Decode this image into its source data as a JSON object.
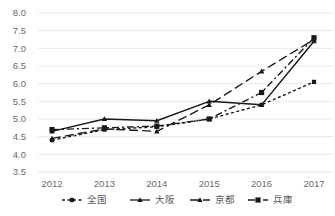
{
  "chart_data": {
    "type": "line",
    "title": "",
    "xlabel": "",
    "ylabel": "",
    "x": [
      "2012",
      "2013",
      "2014",
      "2015",
      "2016",
      "2017"
    ],
    "categories": [
      "2012",
      "2013",
      "2014",
      "2015",
      "2016",
      "2017"
    ],
    "ylim": [
      3.5,
      8.0
    ],
    "ytick_step": 0.5,
    "yticks": [
      "3.5",
      "4.0",
      "4.5",
      "5.0",
      "5.5",
      "6.0",
      "6.5",
      "7.0",
      "7.5",
      "8.0"
    ],
    "grid": "horizontal",
    "legend_position": "bottom",
    "series": [
      {
        "name": "全国",
        "values": [
          4.4,
          4.7,
          4.78,
          5.0,
          5.4,
          6.05
        ],
        "dash": "3,2.5",
        "marker": "square",
        "marker_size": 2.1,
        "stroke_width": 1.4,
        "color": "#1a1a1a"
      },
      {
        "name": "大阪",
        "values": [
          4.65,
          5.0,
          4.95,
          5.5,
          5.4,
          7.2
        ],
        "dash": "none",
        "marker": "triangle",
        "marker_size": 2.6,
        "stroke_width": 1.5,
        "color": "#1a1a1a"
      },
      {
        "name": "京都",
        "values": [
          4.45,
          4.72,
          4.65,
          5.4,
          6.35,
          7.25
        ],
        "dash": "9,4",
        "marker": "triangle",
        "marker_size": 2.6,
        "stroke_width": 1.4,
        "color": "#1a1a1a"
      },
      {
        "name": "兵庫",
        "values": [
          4.7,
          4.75,
          4.8,
          5.0,
          5.75,
          7.3
        ],
        "dash": "7,3,2,3",
        "marker": "square",
        "marker_size": 2.6,
        "stroke_width": 1.4,
        "color": "#1a1a1a"
      }
    ],
    "colors": {
      "gridline": "#e8e8e8",
      "tick_text": "#6b6b6b",
      "legend_text": "#5a5a5a",
      "line": "#1a1a1a",
      "background": "#ffffff"
    }
  }
}
